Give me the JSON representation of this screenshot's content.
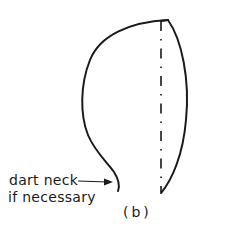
{
  "figure": {
    "annotation": {
      "line1": "dart neck",
      "line2": "if necessary"
    },
    "caption": "(b)",
    "colors": {
      "stroke": "#1a1a1a",
      "background": "#ffffff"
    },
    "elements": {
      "outline": "sleeve-head-outline",
      "centerline": "dash-dot-grain-line",
      "pointer": "arrow-to-neck"
    }
  }
}
